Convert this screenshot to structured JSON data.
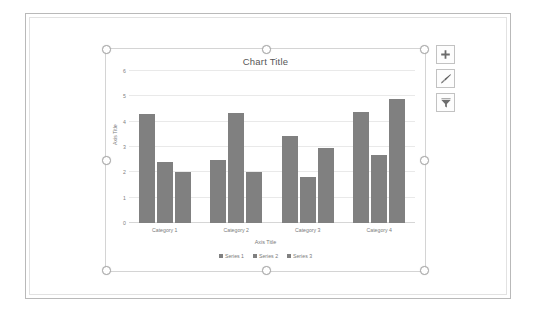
{
  "chart_data": {
    "type": "bar",
    "title": "Chart Title",
    "xlabel": "Axis Title",
    "ylabel": "Axis Title",
    "categories": [
      "Category 1",
      "Category 2",
      "Category 3",
      "Category 4"
    ],
    "series": [
      {
        "name": "Series 1",
        "values": [
          4.3,
          2.5,
          3.45,
          4.4
        ],
        "color": "#808080"
      },
      {
        "name": "Series 2",
        "values": [
          2.4,
          4.35,
          1.8,
          2.7
        ],
        "color": "#808080"
      },
      {
        "name": "Series 3",
        "values": [
          2.0,
          2.0,
          2.95,
          4.9
        ],
        "color": "#808080"
      }
    ],
    "ylim": [
      0,
      6
    ],
    "yticks": [
      0,
      1,
      2,
      3,
      4,
      5,
      6
    ],
    "grid": true,
    "legend_position": "bottom"
  },
  "chart_buttons": [
    {
      "name": "chart-elements-button",
      "icon": "plus-icon",
      "label": "Chart Elements"
    },
    {
      "name": "chart-styles-button",
      "icon": "paintbrush-icon",
      "label": "Chart Styles"
    },
    {
      "name": "chart-filters-button",
      "icon": "funnel-icon",
      "label": "Chart Filters"
    }
  ],
  "selection": {
    "handles": [
      "nw",
      "n",
      "ne",
      "w",
      "e",
      "sw",
      "s",
      "se"
    ]
  },
  "colors": {
    "bar": "#808080",
    "gridline": "#e9e9e9",
    "axis_text": "#7a7a7a",
    "title_text": "#575757"
  }
}
